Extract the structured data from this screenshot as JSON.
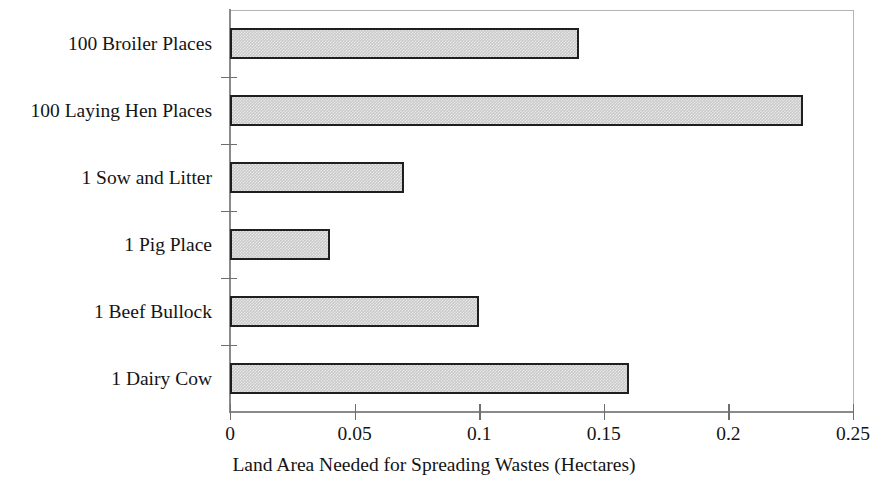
{
  "chart_data": {
    "type": "bar",
    "orientation": "horizontal",
    "title": "",
    "xlabel": "Land Area Needed for Spreading Wastes (Hectares)",
    "ylabel": "",
    "categories": [
      "100 Broiler Places",
      "100 Laying Hen Places",
      "1 Sow and Litter",
      "1 Pig Place",
      "1 Beef Bullock",
      "1 Dairy Cow"
    ],
    "values": [
      0.14,
      0.23,
      0.07,
      0.04,
      0.1,
      0.16
    ],
    "xlim": [
      0,
      0.25
    ],
    "xticks": [
      0,
      0.05,
      0.1,
      0.15,
      0.2,
      0.25
    ],
    "xtick_labels": [
      "0",
      "0.05",
      "0.1",
      "0.15",
      "0.2",
      "0.25"
    ],
    "grid": false,
    "legend": false,
    "bar_fill_color": "#c9c9c9",
    "bar_border_color": "#1f1f1f",
    "axis_color": "#8a8a8a",
    "text_color": "#141414",
    "background_color": "#ffffff"
  }
}
